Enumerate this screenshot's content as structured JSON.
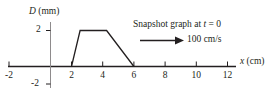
{
  "chart_data": {
    "type": "line",
    "title": "",
    "xlabel": "x (cm)",
    "ylabel": "D (mm)",
    "xlim": [
      -2.8,
      13.2
    ],
    "ylim": [
      -2.6,
      2.6
    ],
    "grid": false,
    "legend": "none",
    "x_ticks": [
      -2,
      2,
      4,
      6,
      8,
      10,
      12
    ],
    "x_tick_labels": [
      "-2",
      "2",
      "4",
      "6",
      "8",
      "10",
      "12"
    ],
    "y_ticks": [
      2,
      -2
    ],
    "y_tick_labels": [
      "2",
      "-2"
    ],
    "series": [
      {
        "name": "wave pulse",
        "x": [
          -2.8,
          2.0,
          2.55,
          4.25,
          6.0,
          13.0
        ],
        "values": [
          0,
          0,
          2,
          2,
          0,
          0
        ]
      }
    ],
    "annotations": [
      {
        "name": "snapshot-caption",
        "text": "Snapshot graph at t = 0",
        "text_plain": "Snapshot graph at ",
        "italic_part": "t",
        "text_tail": " = 0"
      },
      {
        "name": "speed-label",
        "text": "100 cm/s"
      },
      {
        "name": "velocity-arrow",
        "direction": "right",
        "x_start": 6.2,
        "x_end": 10.2,
        "y": 1.0
      }
    ]
  },
  "axes": {
    "y_label_italic": "D",
    "y_label_unit": " (mm)",
    "x_label_italic": "x",
    "x_label_unit": " (cm)",
    "y_tick_top": "2",
    "y_tick_bottom": "-2"
  },
  "x_axis_ticks": [
    {
      "label": "-2",
      "value": -2
    },
    {
      "label": "2",
      "value": 2
    },
    {
      "label": "4",
      "value": 4
    },
    {
      "label": "6",
      "value": 6
    },
    {
      "label": "8",
      "value": 8
    },
    {
      "label": "10",
      "value": 10
    },
    {
      "label": "12",
      "value": 12
    }
  ],
  "annotation": {
    "caption_prefix": "Snapshot graph at ",
    "caption_italic": "t",
    "caption_suffix": " = 0",
    "speed": "100 cm/s"
  },
  "colors": {
    "ink": "#231f20",
    "background": "#ffffff"
  }
}
